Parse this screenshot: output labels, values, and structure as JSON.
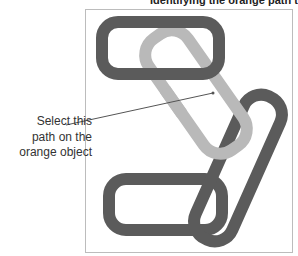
{
  "caption": {
    "text": "Identifying the orange path to select"
  },
  "callout": {
    "lines": [
      "Select this",
      "path on the",
      "orange object"
    ]
  },
  "colors": {
    "dark_shape": "#5b5b5b",
    "light_shape": "#b9b9b9",
    "frame": "#bcbcbc",
    "leader": "#555555"
  },
  "shapes": [
    {
      "name": "top-dark-link",
      "color": "dark"
    },
    {
      "name": "light-orange-link",
      "color": "light"
    },
    {
      "name": "right-dark-link",
      "color": "dark"
    },
    {
      "name": "bottom-dark-link",
      "color": "dark"
    }
  ]
}
